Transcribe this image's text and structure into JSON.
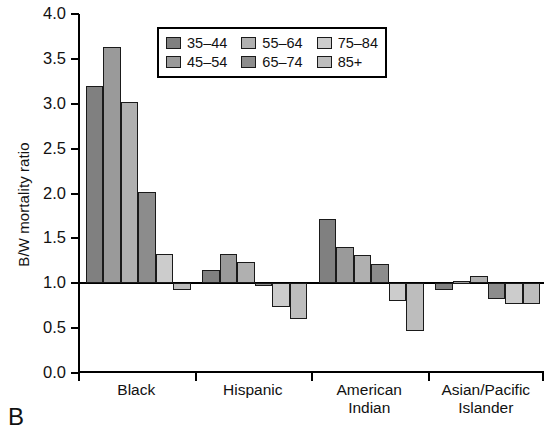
{
  "panel": {
    "letter": "B"
  },
  "chart_data": {
    "type": "bar",
    "title": "",
    "xlabel": "",
    "ylabel": "B/W mortality ratio",
    "ylim": [
      0.0,
      4.0
    ],
    "ytick_labels": [
      "0.0",
      "0.5",
      "1.0",
      "1.5",
      "2.0",
      "2.5",
      "3.0",
      "3.5",
      "4.0"
    ],
    "ytick_values": [
      0.0,
      0.5,
      1.0,
      1.5,
      2.0,
      2.5,
      3.0,
      3.5,
      4.0
    ],
    "grid": false,
    "reference_line": 1.0,
    "legend_position": "top-center",
    "categories": [
      "Black",
      "Hispanic",
      "American Indian",
      "Asian/Pacific Islander"
    ],
    "category_lines": [
      [
        "Black"
      ],
      [
        "Hispanic"
      ],
      [
        "American",
        "Indian"
      ],
      [
        "Asian/Pacific",
        "Islander"
      ]
    ],
    "series": [
      {
        "name": "35–44",
        "color": "#808080",
        "values": [
          3.2,
          1.15,
          1.72,
          0.93
        ]
      },
      {
        "name": "45–54",
        "color": "#9a9a9a",
        "values": [
          3.63,
          1.33,
          1.4,
          1.03
        ]
      },
      {
        "name": "55–64",
        "color": "#b0b0b0",
        "values": [
          3.02,
          1.24,
          1.31,
          1.08
        ]
      },
      {
        "name": "65–74",
        "color": "#8c8c8c",
        "values": [
          2.02,
          0.97,
          1.21,
          0.83
        ]
      },
      {
        "name": "75–84",
        "color": "#cccccc",
        "values": [
          1.33,
          0.74,
          0.8,
          0.77
        ]
      },
      {
        "name": "85+",
        "color": "#bdbdbd",
        "values": [
          0.93,
          0.6,
          0.47,
          0.77
        ]
      }
    ],
    "legend_rows": [
      [
        "35–44",
        "55–64",
        "75–84"
      ],
      [
        "45–54",
        "65–74",
        "85+"
      ]
    ]
  }
}
